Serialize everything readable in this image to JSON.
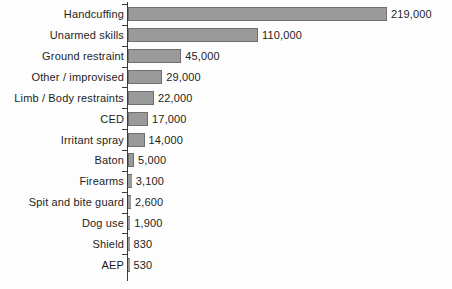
{
  "chart_data": {
    "type": "bar",
    "orientation": "horizontal",
    "title": "",
    "subtitle": "",
    "xlabel": "",
    "ylabel": "",
    "grid": false,
    "legend": null,
    "axis_tick_labels": [],
    "xlim": [
      0,
      219000
    ],
    "categories": [
      "Handcuffing",
      "Unarmed skills",
      "Ground restraint",
      "Other / improvised",
      "Limb / Body restraints",
      "CED",
      "Irritant spray",
      "Baton",
      "Firearms",
      "Spit and bite guard",
      "Dog use",
      "Shield",
      "AEP"
    ],
    "values": [
      219000,
      110000,
      45000,
      29000,
      22000,
      17000,
      14000,
      5000,
      3100,
      2600,
      1900,
      830,
      530
    ],
    "value_labels": [
      "219,000",
      "110,000",
      "45,000",
      "29,000",
      "22,000",
      "17,000",
      "14,000",
      "5,000",
      "3,100",
      "2,600",
      "1,900",
      "830",
      "530"
    ],
    "colors": {
      "bar_fill": "#9a9a9a",
      "bar_stroke": "#6f6f6f",
      "axis": "#3a3a3a",
      "text": "#1d1d1d",
      "background": "#fdfdfd"
    }
  }
}
